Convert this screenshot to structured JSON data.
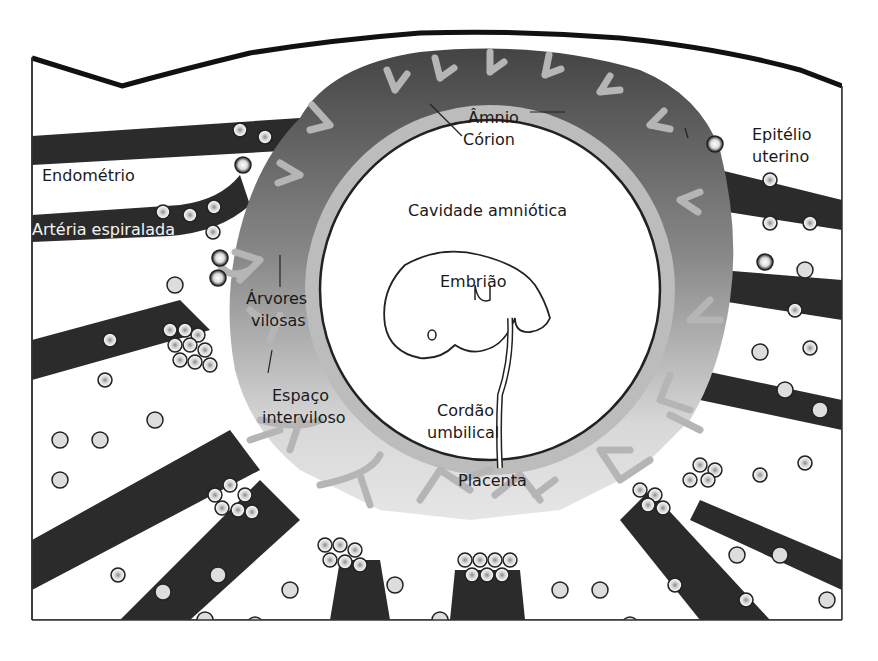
{
  "diagram": {
    "type": "anatomical-illustration",
    "colors": {
      "background": "#ffffff",
      "vessel": "#2b2b2b",
      "placenta_dark": "#4a4a4a",
      "placenta_light": "#bdbdbd",
      "villi": "#a8a8a8",
      "intervillous": "#e2e2e2",
      "outline": "#111111"
    },
    "labels": {
      "amnio": "Âmnio",
      "corion": "Córion",
      "epitelio_line1": "Epitélio",
      "epitelio_line2": "uterino",
      "endometrio": "Endométrio",
      "arteria": "Artéria espiralada",
      "cavidade": "Cavidade amniótica",
      "embriao": "Embrião",
      "arvores_line1": "Árvores",
      "arvores_line2": "vilosas",
      "espaco_line1": "Espaço",
      "espaco_line2": "interviloso",
      "cordao_line1": "Cordão",
      "cordao_line2": "umbilical",
      "placenta": "Placenta"
    }
  }
}
